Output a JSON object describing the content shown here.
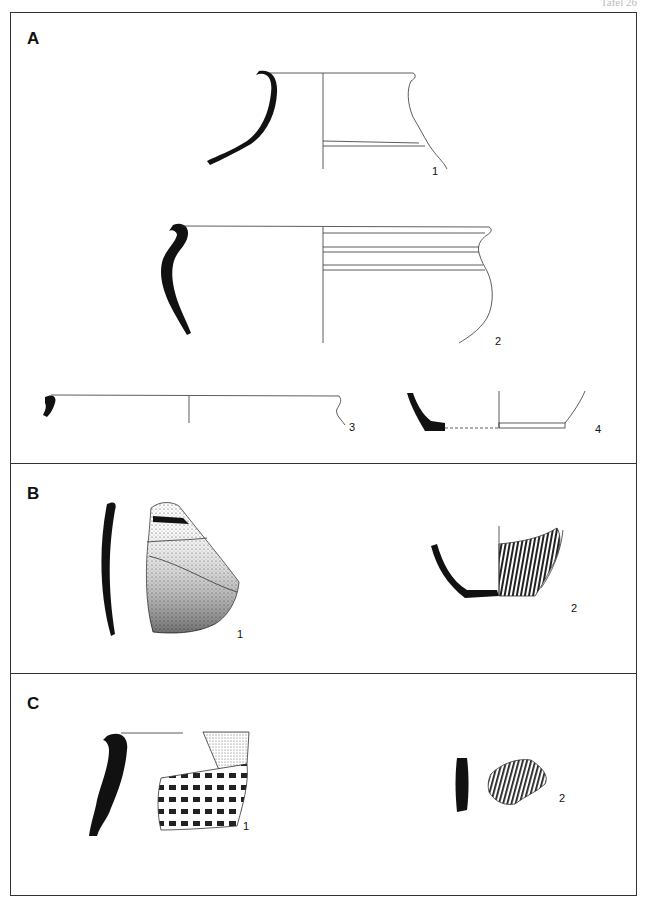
{
  "plate": {
    "header": "Tafel 26"
  },
  "sections": [
    {
      "label": "A",
      "figures": [
        {
          "number": "1",
          "type": "vessel-profile",
          "description": "jar rim/shoulder profile with section and half-view"
        },
        {
          "number": "2",
          "type": "vessel-profile",
          "description": "carinated pot with everted rim, profile and half-view"
        },
        {
          "number": "3",
          "type": "vessel-profile",
          "description": "wide bowl rim profile"
        },
        {
          "number": "4",
          "type": "vessel-profile",
          "description": "vessel base profile"
        }
      ]
    },
    {
      "label": "B",
      "figures": [
        {
          "number": "1",
          "type": "sherd",
          "description": "wall sherd, section and stippled exterior"
        },
        {
          "number": "2",
          "type": "vessel-profile",
          "description": "base with vertical comb decoration"
        }
      ]
    },
    {
      "label": "C",
      "figures": [
        {
          "number": "1",
          "type": "sherd",
          "description": "rim sherd with impressed decoration"
        },
        {
          "number": "2",
          "type": "sherd",
          "description": "wall sherd with vertical grooves"
        }
      ]
    }
  ]
}
